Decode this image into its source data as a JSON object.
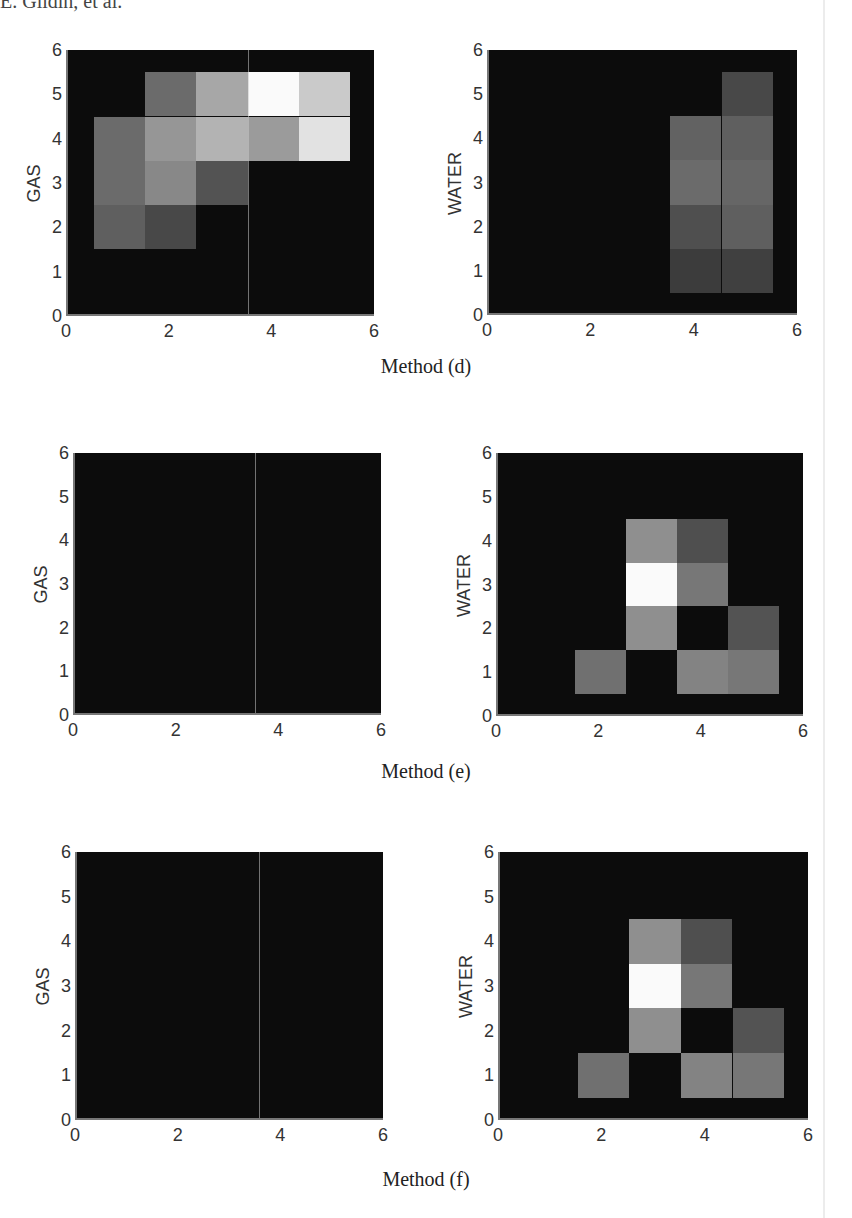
{
  "running_head": "E. Gildin, et al.",
  "captions": [
    "Method (d)",
    "Method (e)",
    "Method (f)"
  ],
  "colors": {
    "background": "#0c0c0c",
    "axis": "#777777",
    "page": "#ffffff"
  },
  "chart_data": [
    {
      "type": "heatmap",
      "title": "",
      "method": "Method (d)",
      "ylabel": "GAS",
      "xlabel": "",
      "xlim": [
        0,
        6
      ],
      "ylim": [
        0,
        6
      ],
      "xticks": [
        0,
        2,
        4,
        6
      ],
      "yticks": [
        0,
        1,
        2,
        3,
        4,
        5,
        6
      ],
      "grid": false,
      "colormap": "gray",
      "cells": [
        {
          "x": 2,
          "y": 5,
          "v": 0.4
        },
        {
          "x": 3,
          "y": 5,
          "v": 0.65
        },
        {
          "x": 4,
          "y": 5,
          "v": 1.0
        },
        {
          "x": 5,
          "y": 5,
          "v": 0.8
        },
        {
          "x": 1,
          "y": 4,
          "v": 0.4
        },
        {
          "x": 2,
          "y": 4,
          "v": 0.58
        },
        {
          "x": 3,
          "y": 4,
          "v": 0.7
        },
        {
          "x": 4,
          "y": 4,
          "v": 0.6
        },
        {
          "x": 5,
          "y": 4,
          "v": 0.9
        },
        {
          "x": 1,
          "y": 3,
          "v": 0.4
        },
        {
          "x": 2,
          "y": 3,
          "v": 0.52
        },
        {
          "x": 3,
          "y": 3,
          "v": 0.3
        },
        {
          "x": 1,
          "y": 2,
          "v": 0.35
        },
        {
          "x": 2,
          "y": 2,
          "v": 0.25
        }
      ]
    },
    {
      "type": "heatmap",
      "title": "",
      "method": "Method (d)",
      "ylabel": "WATER",
      "xlabel": "",
      "xlim": [
        0,
        6
      ],
      "ylim": [
        0,
        6
      ],
      "xticks": [
        0,
        2,
        4,
        6
      ],
      "yticks": [
        0,
        1,
        2,
        3,
        4,
        5,
        6
      ],
      "grid": false,
      "colormap": "gray",
      "cells": [
        {
          "x": 5,
          "y": 5,
          "v": 0.25
        },
        {
          "x": 4,
          "y": 4,
          "v": 0.36
        },
        {
          "x": 5,
          "y": 4,
          "v": 0.35
        },
        {
          "x": 4,
          "y": 3,
          "v": 0.4
        },
        {
          "x": 5,
          "y": 3,
          "v": 0.38
        },
        {
          "x": 4,
          "y": 2,
          "v": 0.28
        },
        {
          "x": 5,
          "y": 2,
          "v": 0.35
        },
        {
          "x": 4,
          "y": 1,
          "v": 0.2
        },
        {
          "x": 5,
          "y": 1,
          "v": 0.22
        }
      ]
    },
    {
      "type": "heatmap",
      "title": "",
      "method": "Method (e)",
      "ylabel": "GAS",
      "xlabel": "",
      "xlim": [
        0,
        6
      ],
      "ylim": [
        0,
        6
      ],
      "xticks": [
        0,
        2,
        4,
        6
      ],
      "yticks": [
        0,
        1,
        2,
        3,
        4,
        5,
        6
      ],
      "grid": false,
      "colormap": "gray",
      "cells": []
    },
    {
      "type": "heatmap",
      "title": "",
      "method": "Method (e)",
      "ylabel": "WATER",
      "xlabel": "",
      "xlim": [
        0,
        6
      ],
      "ylim": [
        0,
        6
      ],
      "xticks": [
        0,
        2,
        4,
        6
      ],
      "yticks": [
        0,
        1,
        2,
        3,
        4,
        5,
        6
      ],
      "grid": false,
      "colormap": "gray",
      "cells": [
        {
          "x": 3,
          "y": 4,
          "v": 0.55
        },
        {
          "x": 4,
          "y": 4,
          "v": 0.28
        },
        {
          "x": 3,
          "y": 3,
          "v": 1.0
        },
        {
          "x": 4,
          "y": 3,
          "v": 0.45
        },
        {
          "x": 3,
          "y": 2,
          "v": 0.55
        },
        {
          "x": 4,
          "y": 2,
          "v": 0.0
        },
        {
          "x": 5,
          "y": 2,
          "v": 0.3
        },
        {
          "x": 2,
          "y": 1,
          "v": 0.42
        },
        {
          "x": 3,
          "y": 1,
          "v": 0.0
        },
        {
          "x": 4,
          "y": 1,
          "v": 0.5
        },
        {
          "x": 5,
          "y": 1,
          "v": 0.45
        }
      ]
    },
    {
      "type": "heatmap",
      "title": "",
      "method": "Method (f)",
      "ylabel": "GAS",
      "xlabel": "",
      "xlim": [
        0,
        6
      ],
      "ylim": [
        0,
        6
      ],
      "xticks": [
        0,
        2,
        4,
        6
      ],
      "yticks": [
        0,
        1,
        2,
        3,
        4,
        5,
        6
      ],
      "grid": false,
      "colormap": "gray",
      "cells": []
    },
    {
      "type": "heatmap",
      "title": "",
      "method": "Method (f)",
      "ylabel": "WATER",
      "xlabel": "",
      "xlim": [
        0,
        6
      ],
      "ylim": [
        0,
        6
      ],
      "xticks": [
        0,
        2,
        4,
        6
      ],
      "yticks": [
        0,
        1,
        2,
        3,
        4,
        5,
        6
      ],
      "grid": false,
      "colormap": "gray",
      "cells": [
        {
          "x": 3,
          "y": 4,
          "v": 0.55
        },
        {
          "x": 4,
          "y": 4,
          "v": 0.28
        },
        {
          "x": 3,
          "y": 3,
          "v": 1.0
        },
        {
          "x": 4,
          "y": 3,
          "v": 0.45
        },
        {
          "x": 3,
          "y": 2,
          "v": 0.55
        },
        {
          "x": 4,
          "y": 2,
          "v": 0.0
        },
        {
          "x": 5,
          "y": 2,
          "v": 0.3
        },
        {
          "x": 2,
          "y": 1,
          "v": 0.42
        },
        {
          "x": 3,
          "y": 1,
          "v": 0.0
        },
        {
          "x": 4,
          "y": 1,
          "v": 0.5
        },
        {
          "x": 5,
          "y": 1,
          "v": 0.45
        }
      ]
    }
  ]
}
